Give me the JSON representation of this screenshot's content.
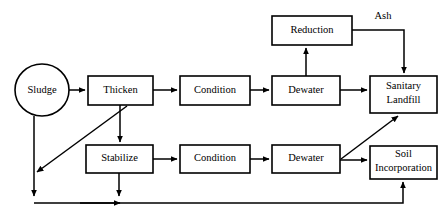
{
  "diagram": {
    "type": "flowchart",
    "canvas": {
      "width": 448,
      "height": 224
    },
    "colors": {
      "background": "#ffffff",
      "stroke": "#000000",
      "node_fill": "#ffffff",
      "text": "#000000"
    },
    "nodes": [
      {
        "id": "sludge",
        "label": "Sludge",
        "shape": "ellipse",
        "cx": 42,
        "cy": 90,
        "rx": 27,
        "ry": 26
      },
      {
        "id": "thicken",
        "label": "Thicken",
        "shape": "rect",
        "x": 88,
        "y": 76,
        "w": 65,
        "h": 29
      },
      {
        "id": "condition-top",
        "label": "Condition",
        "shape": "rect",
        "x": 180,
        "y": 76,
        "w": 70,
        "h": 29
      },
      {
        "id": "dewater-top",
        "label": "Dewater",
        "shape": "rect",
        "x": 272,
        "y": 76,
        "w": 68,
        "h": 29
      },
      {
        "id": "reduction",
        "label": "Reduction",
        "shape": "rect",
        "x": 272,
        "y": 16,
        "w": 80,
        "h": 29
      },
      {
        "id": "sanitary-landfill",
        "label": "Sanitary Landfill",
        "label_line1": "Sanitary",
        "label_line2": "Landfill",
        "shape": "rect",
        "x": 370,
        "y": 76,
        "w": 67,
        "h": 37
      },
      {
        "id": "stabilize",
        "label": "Stabilize",
        "shape": "rect",
        "x": 86,
        "y": 145,
        "w": 67,
        "h": 28
      },
      {
        "id": "condition-bottom",
        "label": "Condition",
        "shape": "rect",
        "x": 180,
        "y": 145,
        "w": 70,
        "h": 28
      },
      {
        "id": "dewater-bottom",
        "label": "Dewater",
        "shape": "rect",
        "x": 272,
        "y": 145,
        "w": 68,
        "h": 28
      },
      {
        "id": "soil-incorporation",
        "label": "Soil Incorporation",
        "label_line1": "Soil",
        "label_line2": "Incorporation",
        "shape": "rect",
        "x": 370,
        "y": 146,
        "w": 67,
        "h": 33
      }
    ],
    "edges": [
      {
        "id": "sludge-to-thicken",
        "from": "sludge",
        "to": "thicken",
        "label": ""
      },
      {
        "id": "thicken-to-condition-top",
        "from": "thicken",
        "to": "condition-top",
        "label": ""
      },
      {
        "id": "condition-top-to-dewater-top",
        "from": "condition-top",
        "to": "dewater-top",
        "label": ""
      },
      {
        "id": "dewater-top-to-reduction",
        "from": "dewater-top",
        "to": "reduction",
        "label": ""
      },
      {
        "id": "reduction-to-sanitary-landfill",
        "from": "reduction",
        "to": "sanitary-landfill",
        "label": "Ash"
      },
      {
        "id": "dewater-top-to-sanitary-landfill",
        "from": "dewater-top",
        "to": "sanitary-landfill",
        "label": ""
      },
      {
        "id": "thicken-to-stabilize",
        "from": "thicken",
        "to": "stabilize",
        "label": ""
      },
      {
        "id": "thicken-to-return-line",
        "from": "thicken",
        "to": "return-line",
        "label": ""
      },
      {
        "id": "stabilize-to-condition-bottom",
        "from": "stabilize",
        "to": "condition-bottom",
        "label": ""
      },
      {
        "id": "condition-bottom-to-dewater-bottom",
        "from": "condition-bottom",
        "to": "dewater-bottom",
        "label": ""
      },
      {
        "id": "dewater-bottom-to-soil-incorporation",
        "from": "dewater-bottom",
        "to": "soil-incorporation",
        "label": ""
      },
      {
        "id": "dewater-bottom-to-sanitary-landfill",
        "from": "dewater-bottom",
        "to": "sanitary-landfill",
        "label": ""
      },
      {
        "id": "sludge-to-return-line",
        "from": "sludge",
        "to": "return-line",
        "label": ""
      },
      {
        "id": "stabilize-to-return-line",
        "from": "stabilize",
        "to": "return-line",
        "label": ""
      },
      {
        "id": "return-line-to-soil-incorporation",
        "from": "return-line",
        "to": "soil-incorporation",
        "label": ""
      }
    ],
    "edge_labels": [
      {
        "id": "ash-label",
        "text": "Ash",
        "x": 383,
        "y": 16
      }
    ]
  }
}
